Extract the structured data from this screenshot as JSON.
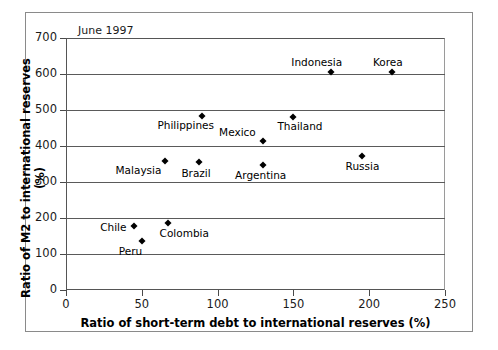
{
  "chart_data": {
    "type": "scatter",
    "title": "",
    "annotation": "June 1997",
    "xlabel": "Ratio of short-term debt to international reserves (%)",
    "ylabel": "Ratio of M2 to international reserves (%)",
    "xlim": [
      0,
      250
    ],
    "ylim": [
      0,
      700
    ],
    "xticks": [
      0,
      50,
      100,
      150,
      200,
      250
    ],
    "yticks": [
      0,
      100,
      200,
      300,
      400,
      500,
      600,
      700
    ],
    "grid": "horizontal",
    "legend": "none",
    "marker_color": "#000000",
    "points": [
      {
        "label": "Indonesia",
        "x": 175,
        "y": 605,
        "label_dx": -40,
        "label_dy": -15
      },
      {
        "label": "Korea",
        "x": 215,
        "y": 605,
        "label_dx": -19,
        "label_dy": -15
      },
      {
        "label": "Thailand",
        "x": 150,
        "y": 480,
        "label_dx": -16,
        "label_dy": 4
      },
      {
        "label": "Philippines",
        "x": 90,
        "y": 482,
        "label_dx": -45,
        "label_dy": 4
      },
      {
        "label": "Mexico",
        "x": 130,
        "y": 413,
        "label_dx": -44,
        "label_dy": -14
      },
      {
        "label": "Russia",
        "x": 195,
        "y": 372,
        "label_dx": -16,
        "label_dy": 5
      },
      {
        "label": "Malaysia",
        "x": 65,
        "y": 358,
        "label_dx": -49,
        "label_dy": 4
      },
      {
        "label": "Brazil",
        "x": 88,
        "y": 355,
        "label_dx": -18,
        "label_dy": 6
      },
      {
        "label": "Argentina",
        "x": 130,
        "y": 348,
        "label_dx": -28,
        "label_dy": 5
      },
      {
        "label": "Colombia",
        "x": 67,
        "y": 185,
        "label_dx": -8,
        "label_dy": 5
      },
      {
        "label": "Chile",
        "x": 45,
        "y": 177,
        "label_dx": -34,
        "label_dy": -4
      },
      {
        "label": "Peru",
        "x": 50,
        "y": 136,
        "label_dx": -23,
        "label_dy": 5
      }
    ]
  }
}
